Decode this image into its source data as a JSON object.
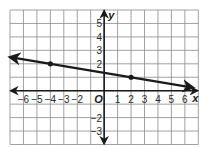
{
  "chart_data": {
    "type": "line",
    "title": "",
    "xlabel": "x",
    "ylabel": "y",
    "origin_label": "O",
    "xlim": [
      -7,
      7
    ],
    "ylim": [
      -4,
      6
    ],
    "grid": true,
    "x_ticks": [
      {
        "value": -6,
        "label": "−6"
      },
      {
        "value": -5,
        "label": "−5"
      },
      {
        "value": -4,
        "label": "−4"
      },
      {
        "value": -3,
        "label": "−3"
      },
      {
        "value": -2,
        "label": "−2"
      },
      {
        "value": 1,
        "label": "1"
      },
      {
        "value": 2,
        "label": "2"
      },
      {
        "value": 3,
        "label": "3"
      },
      {
        "value": 4,
        "label": "4"
      },
      {
        "value": 5,
        "label": "5"
      },
      {
        "value": 6,
        "label": "6"
      }
    ],
    "y_ticks": [
      {
        "value": 5,
        "label": "5"
      },
      {
        "value": 4,
        "label": "4"
      },
      {
        "value": 3,
        "label": "3"
      },
      {
        "value": 2,
        "label": "2"
      },
      {
        "value": -2,
        "label": "−2"
      },
      {
        "value": -3,
        "label": "−3"
      }
    ],
    "series": [
      {
        "name": "line",
        "slope": -0.16667,
        "intercept": 1.3333,
        "arrows": "both",
        "x_range": [
          -7,
          6.6
        ],
        "points": [
          {
            "x": -4,
            "y": 2
          },
          {
            "x": 2,
            "y": 1
          }
        ]
      }
    ],
    "colors": {
      "grid": "#8a8a8a",
      "axis": "#1a1a1a",
      "line": "#1a1a1a",
      "point": "#1a1a1a"
    }
  }
}
